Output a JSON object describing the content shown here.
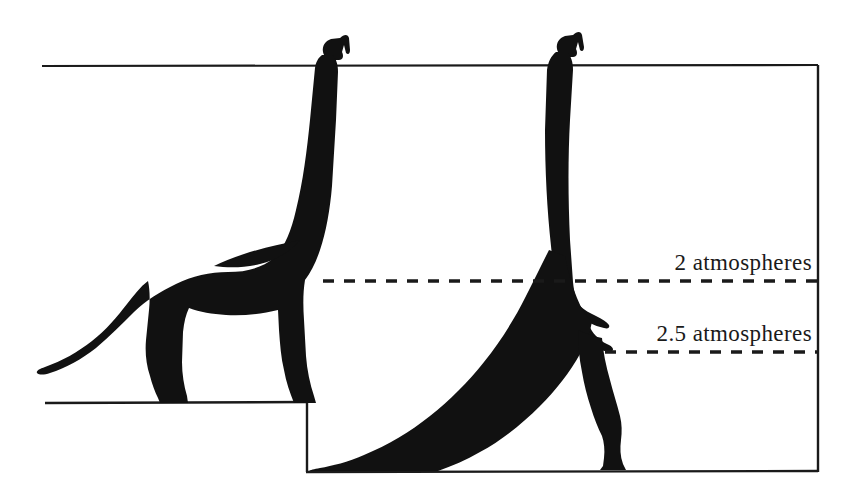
{
  "figure": {
    "background_color": "#ffffff",
    "ink_color": "#1a1a1a",
    "silhouette_color": "#111111",
    "width": 854,
    "height": 498
  },
  "annotations": {
    "pressure_labels": [
      {
        "id": "two-atmospheres",
        "text": "2  atmospheres",
        "value": 2,
        "unit": "atmospheres",
        "line_y": 281,
        "line_style": "dashed",
        "line_x_start": 323,
        "line_x_end": 818
      },
      {
        "id": "two-point-five-atmospheres",
        "text": "2.5  atmospheres",
        "value": 2.5,
        "unit": "atmospheres",
        "line_y": 352,
        "line_style": "dashed",
        "line_x_start": 605,
        "line_x_end": 818
      }
    ]
  },
  "frame": {
    "top_rule_y": 66,
    "top_rule_x_start": 42,
    "top_rule_x_end": 818,
    "right_rule_x": 818,
    "upper_ground_y": 402,
    "upper_ground_x_start": 45,
    "upper_ground_x_end": 307,
    "step_riser_x": 307,
    "lower_ground_y": 472,
    "lower_ground_x_start": 307,
    "lower_ground_x_end": 818
  },
  "subjects": [
    {
      "id": "standing-sauropod",
      "name": "Brachiosaurus standing on raised ground",
      "posture": "quadrupedal standing",
      "head_top_y": 36,
      "ground_y": 402,
      "head_above_top_rule": true
    },
    {
      "id": "rearing-sauropod",
      "name": "Brachiosaurus rearing on lower ground",
      "posture": "bipedal rearing, tail on ground",
      "head_top_y": 33,
      "ground_y": 472,
      "head_above_top_rule": true
    }
  ]
}
